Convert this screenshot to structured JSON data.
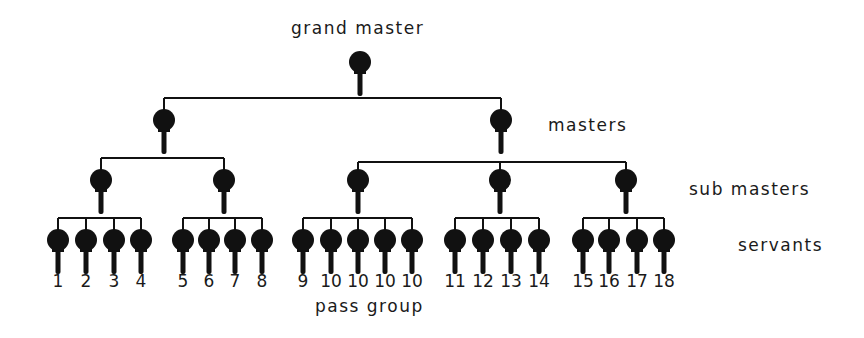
{
  "diagram": {
    "labels": {
      "grand_master": "grand master",
      "masters": "masters",
      "sub_masters": "sub masters",
      "servants": "servants",
      "pass_group": "pass group"
    },
    "colors": {
      "ink": "#111111",
      "background": "#ffffff"
    },
    "node_icon": "key-icon",
    "grand_master": {
      "x": 360
    },
    "masters": [
      {
        "x": 164,
        "sub_masters": [
          0,
          1
        ]
      },
      {
        "x": 501,
        "sub_masters": [
          2,
          3,
          4
        ]
      }
    ],
    "sub_masters": [
      {
        "x": 101,
        "servants": [
          0,
          1,
          2,
          3
        ]
      },
      {
        "x": 224,
        "servants": [
          4,
          5,
          6,
          7
        ]
      },
      {
        "x": 358,
        "servants": [
          8,
          9,
          10,
          11,
          12
        ]
      },
      {
        "x": 500,
        "servants": [
          13,
          14,
          15,
          16
        ]
      },
      {
        "x": 626,
        "servants": [
          17,
          18,
          19,
          20
        ]
      }
    ],
    "servants": [
      {
        "x": 58,
        "label": "1"
      },
      {
        "x": 86,
        "label": "2"
      },
      {
        "x": 114,
        "label": "3"
      },
      {
        "x": 141,
        "label": "4"
      },
      {
        "x": 183,
        "label": "5"
      },
      {
        "x": 209,
        "label": "6"
      },
      {
        "x": 235,
        "label": "7"
      },
      {
        "x": 262,
        "label": "8"
      },
      {
        "x": 303,
        "label": "9"
      },
      {
        "x": 331,
        "label": "10"
      },
      {
        "x": 358,
        "label": "10"
      },
      {
        "x": 385,
        "label": "10"
      },
      {
        "x": 412,
        "label": "10"
      },
      {
        "x": 455,
        "label": "11"
      },
      {
        "x": 483,
        "label": "12"
      },
      {
        "x": 511,
        "label": "13"
      },
      {
        "x": 539,
        "label": "14"
      },
      {
        "x": 583,
        "label": "15"
      },
      {
        "x": 609,
        "label": "16"
      },
      {
        "x": 637,
        "label": "17"
      },
      {
        "x": 664,
        "label": "18"
      }
    ]
  }
}
